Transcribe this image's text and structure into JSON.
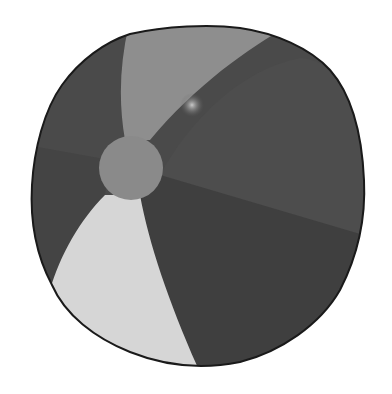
{
  "image": {
    "subject": "beach ball",
    "style": "grayscale illustration",
    "panels": [
      {
        "name": "top-light-panel",
        "color": "#8e8e8e"
      },
      {
        "name": "top-left-dark-panel",
        "color": "#4a4a4a"
      },
      {
        "name": "right-upper-panel",
        "color": "#4d4d4d"
      },
      {
        "name": "right-lower-panel",
        "color": "#3f3f3f"
      },
      {
        "name": "left-lower-panel",
        "color": "#444444"
      },
      {
        "name": "bottom-white-panel",
        "color": "#d6d6d6"
      }
    ],
    "center_cap_color": "#8a8a8a",
    "outline_color": "#1a1a1a",
    "highlight_color": "#bdbdbd"
  }
}
